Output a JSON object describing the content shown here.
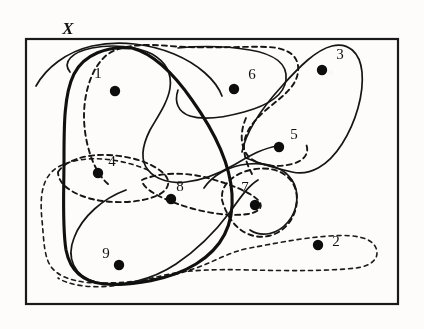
{
  "figure": {
    "type": "set-cover-diagram",
    "universe_label": "X",
    "frame": {
      "x": 25,
      "y": 38,
      "width": 374,
      "height": 267
    },
    "points": [
      {
        "id": "1",
        "label": "1",
        "cx": 115,
        "cy": 91,
        "lx": 98,
        "ly": 78,
        "r": 5.2
      },
      {
        "id": "2",
        "label": "2",
        "cx": 318,
        "cy": 245,
        "lx": 333,
        "ly": 245,
        "r": 5.2
      },
      {
        "id": "3",
        "label": "3",
        "cx": 322,
        "cy": 70,
        "lx": 338,
        "ly": 58,
        "r": 5.2
      },
      {
        "id": "4",
        "label": "4",
        "cx": 98,
        "cy": 173,
        "lx": 109,
        "ly": 166,
        "r": 5.2
      },
      {
        "id": "5",
        "label": "5",
        "cx": 279,
        "cy": 147,
        "lx": 292,
        "ly": 139,
        "r": 5.2
      },
      {
        "id": "6",
        "label": "6",
        "cx": 234,
        "cy": 89,
        "lx": 249,
        "ly": 79,
        "r": 5.2
      },
      {
        "id": "7",
        "label": "7",
        "cx": 255,
        "cy": 205,
        "lx": 243,
        "ly": 192,
        "r": 5.2
      },
      {
        "id": "8",
        "label": "8",
        "cx": 171,
        "cy": 199,
        "lx": 178,
        "ly": 191,
        "r": 5.2
      },
      {
        "id": "9",
        "label": "9",
        "cx": 119,
        "cy": 265,
        "lx": 105,
        "ly": 258,
        "r": 5.2
      }
    ],
    "regions": [
      {
        "name": "solid-thick-blob",
        "style": "solid-thick",
        "contains": [
          "1",
          "4",
          "9",
          "8"
        ]
      },
      {
        "name": "solid-thin-sweep",
        "style": "solid-thin",
        "contains": [
          "1"
        ]
      },
      {
        "name": "solid-thin-lower",
        "style": "solid-thin",
        "contains": [
          "9",
          "8"
        ]
      },
      {
        "name": "solid-thin-six",
        "style": "solid-thin",
        "contains": [
          "6"
        ]
      },
      {
        "name": "solid-thin-three",
        "style": "solid-thin",
        "contains": [
          "3",
          "5"
        ]
      },
      {
        "name": "solid-thin-seven",
        "style": "solid-thin",
        "contains": [
          "7"
        ]
      },
      {
        "name": "dashed-top-sweep",
        "style": "dashed",
        "contains": [
          "1",
          "6"
        ]
      },
      {
        "name": "dashed-four",
        "style": "dashed",
        "contains": [
          "4"
        ]
      },
      {
        "name": "dashed-five",
        "style": "dashed",
        "contains": [
          "5"
        ]
      },
      {
        "name": "dashed-seven",
        "style": "dashed",
        "contains": [
          "7"
        ]
      },
      {
        "name": "dashed-eight",
        "style": "dashed",
        "contains": [
          "8"
        ]
      },
      {
        "name": "dashed-outer-left",
        "style": "dashed-fine",
        "contains": [
          "4",
          "9",
          "8",
          "2"
        ]
      }
    ]
  }
}
